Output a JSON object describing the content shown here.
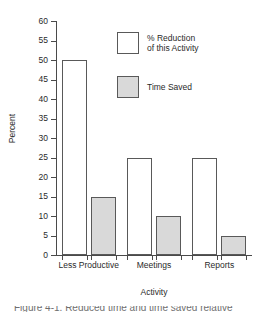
{
  "chart_data": {
    "type": "bar",
    "title": "",
    "xlabel": "Activity",
    "ylabel": "Percent",
    "categories": [
      "Less Productive",
      "Meetings",
      "Reports"
    ],
    "series": [
      {
        "name": "% Reduction\nof this Activity",
        "values": [
          50,
          25,
          25
        ],
        "color": "#ffffff"
      },
      {
        "name": "Time Saved",
        "values": [
          15,
          10,
          5
        ],
        "color": "#d9d9d9"
      }
    ],
    "ylim": [
      0,
      60
    ],
    "ytick_step": 5,
    "yticks": [
      0,
      5,
      10,
      15,
      20,
      25,
      30,
      35,
      40,
      45,
      50,
      55,
      60
    ],
    "grid": false,
    "legend_position": "upper center"
  },
  "axes": {
    "y_title": "Percent",
    "x_title": "Activity",
    "axis_color": "#4a4a4a"
  },
  "legend": {
    "entries": [
      {
        "label": "% Reduction\nof this Activity",
        "swatch": "white-square"
      },
      {
        "label": "Time Saved",
        "swatch": "gray-square"
      }
    ]
  },
  "caption": {
    "cropped_text": "Figure 4-1. Reduced time and time saved relative"
  }
}
